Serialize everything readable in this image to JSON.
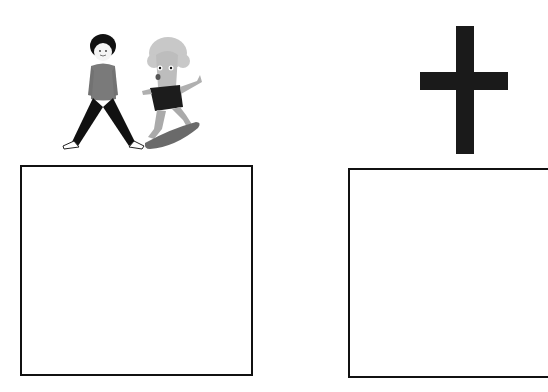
{
  "panels": [
    {
      "id": "left",
      "illustration": "two-characters-icon",
      "illustration_desc": "boy in sweater standing with legs apart beside a curly-haired character riding a skateboard",
      "answer_box_value": ""
    },
    {
      "id": "right",
      "illustration": "cross-icon",
      "illustration_desc": "black Latin cross",
      "answer_box_value": ""
    }
  ],
  "colors": {
    "outline": "#111111",
    "background": "#ffffff",
    "cross": "#1a1a1a",
    "sweater": "#7a7a7a",
    "pants": "#111111",
    "skater_skin": "#b9b9b9",
    "skater_shirt": "#1c1c1c",
    "skateboard": "#6a6a6a"
  }
}
